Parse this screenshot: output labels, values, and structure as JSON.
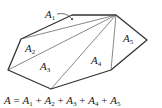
{
  "diagram": {
    "vertices": {
      "top_left": [
        72,
        15
      ],
      "apex": [
        116,
        15
      ],
      "right": [
        147,
        40
      ],
      "bottom_right": [
        111,
        70
      ],
      "bottom": [
        51,
        89
      ],
      "left": [
        8,
        70
      ],
      "upper_left": [
        21,
        39
      ]
    },
    "regions": [
      {
        "label": "A",
        "sub": "1",
        "x": 45,
        "y": 18
      },
      {
        "label": "A",
        "sub": "2",
        "x": 25,
        "y": 52
      },
      {
        "label": "A",
        "sub": "3",
        "x": 40,
        "y": 70
      },
      {
        "label": "A",
        "sub": "4",
        "x": 91,
        "y": 64
      },
      {
        "label": "A",
        "sub": "5",
        "x": 123,
        "y": 42
      }
    ],
    "formula": {
      "lhs": "A",
      "eq": " = ",
      "terms": [
        "A",
        "A",
        "A",
        "A",
        "A"
      ],
      "subs": [
        "1",
        "2",
        "3",
        "4",
        "5"
      ]
    },
    "colors": {
      "outline": "#333333",
      "diagonal": "#555555",
      "text": "#222222"
    }
  }
}
